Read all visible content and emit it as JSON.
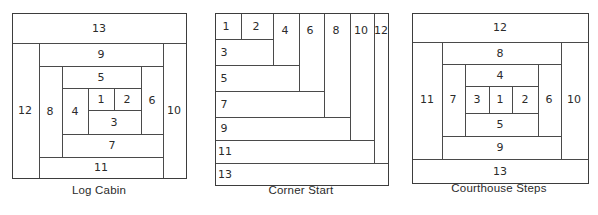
{
  "figure": {
    "type": "quilt-block-piecing-diagrams",
    "background_color": "#ffffff",
    "line_color": "#4a4a4a",
    "text_color": "#2b2b2b"
  },
  "blocks": [
    {
      "id": "log-cabin",
      "caption": "Log Cabin",
      "frame": {
        "x": 12,
        "y": 13,
        "width": 174,
        "height": 165
      },
      "description": "Spiral log cabin piecing order, center square 1, logs added clockwise",
      "pieces": [
        {
          "n": "1",
          "x": 88,
          "y": 88,
          "w": 26,
          "h": 22,
          "label_x": 101,
          "label_y": 99
        },
        {
          "n": "2",
          "x": 114,
          "y": 88,
          "w": 27,
          "h": 22,
          "label_x": 127,
          "label_y": 99
        },
        {
          "n": "3",
          "x": 88,
          "y": 110,
          "w": 53,
          "h": 24,
          "label_x": 114,
          "label_y": 122
        },
        {
          "n": "4",
          "x": 62,
          "y": 88,
          "w": 26,
          "h": 46,
          "label_x": 75,
          "label_y": 111
        },
        {
          "n": "5",
          "x": 62,
          "y": 66,
          "w": 79,
          "h": 22,
          "label_x": 101,
          "label_y": 77
        },
        {
          "n": "6",
          "x": 141,
          "y": 66,
          "w": 22,
          "h": 68,
          "label_x": 152,
          "label_y": 100
        },
        {
          "n": "7",
          "x": 62,
          "y": 134,
          "w": 101,
          "h": 23,
          "label_x": 112,
          "label_y": 145
        },
        {
          "n": "8",
          "x": 39,
          "y": 66,
          "w": 23,
          "h": 91,
          "label_x": 50,
          "label_y": 111
        },
        {
          "n": "9",
          "x": 39,
          "y": 43,
          "w": 124,
          "h": 23,
          "label_x": 101,
          "label_y": 54
        },
        {
          "n": "10",
          "x": 163,
          "y": 43,
          "w": 23,
          "h": 135,
          "label_x": 174,
          "label_y": 110
        },
        {
          "n": "11",
          "x": 39,
          "y": 157,
          "w": 124,
          "h": 21,
          "label_x": 101,
          "label_y": 167
        },
        {
          "n": "12",
          "x": 12,
          "y": 43,
          "w": 27,
          "h": 135,
          "label_x": 25,
          "label_y": 110
        },
        {
          "n": "13",
          "x": 12,
          "y": 13,
          "w": 174,
          "h": 30,
          "label_x": 99,
          "label_y": 28
        }
      ]
    },
    {
      "id": "corner-start",
      "caption": "Corner Start",
      "frame": {
        "x": 215,
        "y": 13,
        "width": 173,
        "height": 172
      },
      "description": "Corner start piecing order, strips added diagonally from top-left corner",
      "pieces": [
        {
          "n": "1",
          "x": 215,
          "y": 13,
          "w": 26,
          "h": 26,
          "label_x": 226,
          "label_y": 26
        },
        {
          "n": "2",
          "x": 241,
          "y": 13,
          "w": 32,
          "h": 26,
          "label_x": 256,
          "label_y": 26
        },
        {
          "n": "3",
          "x": 215,
          "y": 39,
          "w": 58,
          "h": 26,
          "label_x": 224,
          "label_y": 52
        },
        {
          "n": "4",
          "x": 273,
          "y": 13,
          "w": 26,
          "h": 52,
          "label_x": 285,
          "label_y": 30
        },
        {
          "n": "5",
          "x": 215,
          "y": 65,
          "w": 84,
          "h": 26,
          "label_x": 224,
          "label_y": 78
        },
        {
          "n": "6",
          "x": 299,
          "y": 13,
          "w": 25,
          "h": 78,
          "label_x": 310,
          "label_y": 30
        },
        {
          "n": "7",
          "x": 215,
          "y": 91,
          "w": 109,
          "h": 26,
          "label_x": 224,
          "label_y": 104
        },
        {
          "n": "8",
          "x": 324,
          "y": 13,
          "w": 26,
          "h": 104,
          "label_x": 336,
          "label_y": 30
        },
        {
          "n": "9",
          "x": 215,
          "y": 117,
          "w": 135,
          "h": 23,
          "label_x": 224,
          "label_y": 128
        },
        {
          "n": "10",
          "x": 350,
          "y": 13,
          "w": 24,
          "h": 127,
          "label_x": 361,
          "label_y": 30
        },
        {
          "n": "11",
          "x": 215,
          "y": 140,
          "w": 159,
          "h": 23,
          "label_x": 225,
          "label_y": 151
        },
        {
          "n": "12",
          "x": 374,
          "y": 13,
          "w": 14,
          "h": 150,
          "label_x": 381,
          "label_y": 30
        },
        {
          "n": "13",
          "x": 215,
          "y": 163,
          "w": 173,
          "h": 22,
          "label_x": 225,
          "label_y": 174
        }
      ]
    },
    {
      "id": "courthouse-steps",
      "caption": "Courthouse Steps",
      "frame": {
        "x": 412,
        "y": 13,
        "width": 176,
        "height": 170
      },
      "description": "Courthouse steps piecing order, strips added in opposing pairs",
      "pieces": [
        {
          "n": "1",
          "x": 489,
          "y": 86,
          "w": 23,
          "h": 27,
          "label_x": 500,
          "label_y": 99
        },
        {
          "n": "2",
          "x": 512,
          "y": 86,
          "w": 26,
          "h": 27,
          "label_x": 525,
          "label_y": 99
        },
        {
          "n": "3",
          "x": 465,
          "y": 86,
          "w": 24,
          "h": 27,
          "label_x": 477,
          "label_y": 99
        },
        {
          "n": "4",
          "x": 465,
          "y": 64,
          "w": 73,
          "h": 22,
          "label_x": 500,
          "label_y": 75
        },
        {
          "n": "5",
          "x": 465,
          "y": 113,
          "w": 73,
          "h": 23,
          "label_x": 500,
          "label_y": 124
        },
        {
          "n": "6",
          "x": 538,
          "y": 64,
          "w": 23,
          "h": 72,
          "label_x": 549,
          "label_y": 99
        },
        {
          "n": "7",
          "x": 442,
          "y": 64,
          "w": 23,
          "h": 72,
          "label_x": 453,
          "label_y": 99
        },
        {
          "n": "8",
          "x": 442,
          "y": 42,
          "w": 119,
          "h": 22,
          "label_x": 500,
          "label_y": 53
        },
        {
          "n": "9",
          "x": 442,
          "y": 136,
          "w": 119,
          "h": 23,
          "label_x": 500,
          "label_y": 147
        },
        {
          "n": "10",
          "x": 561,
          "y": 42,
          "w": 27,
          "h": 117,
          "label_x": 574,
          "label_y": 99
        },
        {
          "n": "11",
          "x": 412,
          "y": 42,
          "w": 30,
          "h": 117,
          "label_x": 427,
          "label_y": 99
        },
        {
          "n": "12",
          "x": 412,
          "y": 13,
          "w": 176,
          "h": 29,
          "label_x": 500,
          "label_y": 27
        },
        {
          "n": "13",
          "x": 412,
          "y": 159,
          "w": 176,
          "h": 24,
          "label_x": 500,
          "label_y": 171
        }
      ]
    }
  ],
  "captions": {
    "log_cabin": {
      "text": "Log Cabin",
      "center_x": 99,
      "y": 190
    },
    "corner_start": {
      "text": "Corner Start",
      "center_x": 301,
      "y": 190
    },
    "courthouse_steps": {
      "text": "Courthouse Steps",
      "center_x": 500,
      "y": 188
    }
  }
}
